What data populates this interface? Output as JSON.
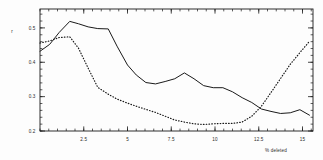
{
  "chart_data": {
    "type": "line",
    "title": "",
    "xlabel": "% deleted",
    "ylabel": "r",
    "xlim": [
      0,
      15.6
    ],
    "ylim": [
      0.2,
      0.555
    ],
    "grid": false,
    "legend": "none",
    "x_ticks": [
      2.5,
      5,
      7.5,
      10,
      12.5,
      15
    ],
    "x_tick_labels": [
      "2.5",
      "5",
      "7.5",
      "10",
      "12.5",
      "15"
    ],
    "x_minor_step": 0.5,
    "y_ticks": [
      0.2,
      0.3,
      0.4,
      0.5
    ],
    "y_tick_labels": [
      "0.2",
      "0.3",
      "0.4",
      "0.5"
    ],
    "y_minor_step": 0.02,
    "series": [
      {
        "name": "solid",
        "style": "solid",
        "color": "#1a1a1a",
        "x": [
          0.0,
          0.55,
          1.1,
          1.7,
          2.2,
          2.75,
          3.3,
          3.9,
          4.4,
          5.0,
          5.5,
          6.05,
          6.6,
          7.15,
          7.7,
          8.25,
          8.8,
          9.35,
          9.9,
          10.45,
          11.0,
          11.55,
          12.1,
          12.65,
          13.2,
          13.75,
          14.3,
          14.85,
          15.4
        ],
        "y": [
          0.432,
          0.452,
          0.487,
          0.519,
          0.512,
          0.503,
          0.498,
          0.497,
          0.447,
          0.392,
          0.363,
          0.341,
          0.337,
          0.344,
          0.352,
          0.369,
          0.352,
          0.332,
          0.326,
          0.326,
          0.314,
          0.297,
          0.283,
          0.264,
          0.257,
          0.251,
          0.253,
          0.262,
          0.246
        ]
      },
      {
        "name": "dotted",
        "style": "dotted",
        "color": "#1a1a1a",
        "x": [
          0.0,
          0.55,
          1.1,
          1.7,
          2.2,
          2.75,
          3.3,
          3.9,
          4.4,
          5.0,
          5.5,
          6.05,
          6.6,
          7.15,
          7.7,
          8.25,
          8.8,
          9.35,
          9.9,
          10.45,
          11.0,
          11.55,
          12.1,
          12.65,
          13.2,
          13.75,
          14.3,
          14.85,
          15.4
        ],
        "y": [
          0.456,
          0.462,
          0.472,
          0.474,
          0.441,
          0.383,
          0.327,
          0.307,
          0.293,
          0.281,
          0.272,
          0.263,
          0.254,
          0.243,
          0.232,
          0.226,
          0.221,
          0.219,
          0.221,
          0.222,
          0.222,
          0.226,
          0.243,
          0.272,
          0.312,
          0.353,
          0.394,
          0.428,
          0.461
        ]
      }
    ]
  },
  "axes": {
    "y_axis_title": "r",
    "x_axis_title": "% deleted"
  }
}
